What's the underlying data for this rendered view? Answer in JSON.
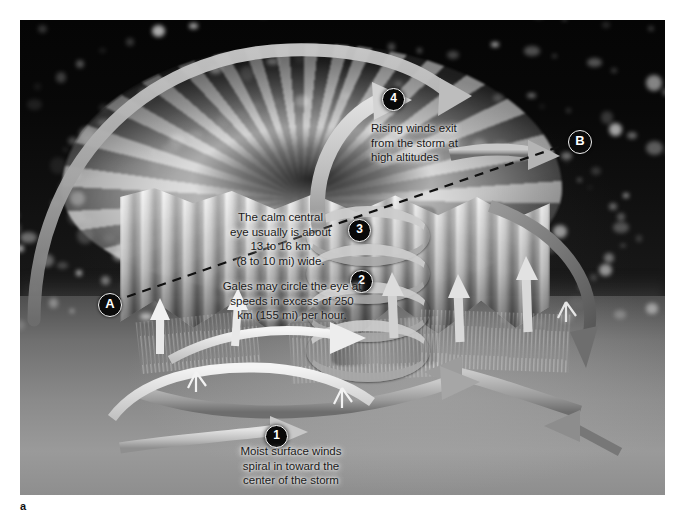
{
  "figure": {
    "panel_letter": "a",
    "frame": {
      "left": 20,
      "top": 20,
      "width": 645,
      "height": 475
    }
  },
  "section_line": {
    "label": "cross-section-line",
    "style": "dashed",
    "endpoints": [
      {
        "id": "A",
        "label": "A",
        "x": 78,
        "y": 273
      },
      {
        "id": "B",
        "label": "B",
        "x": 548,
        "y": 110
      }
    ]
  },
  "annotations": [
    {
      "number": "1",
      "marker": {
        "x": 245,
        "y": 405
      },
      "text": "Moist surface winds\nspiral in  toward the\ncenter of the storm",
      "text_box": {
        "x": 196,
        "y": 424,
        "width": 150
      },
      "align": "center"
    },
    {
      "number": "2",
      "marker": {
        "x": 330,
        "y": 250
      },
      "text": "Gales may circle the eye at\nspeeds in excess of 250\nkm (155 mi) per hour.",
      "text_box": {
        "x": 178,
        "y": 259,
        "width": 188
      },
      "align": "center"
    },
    {
      "number": "3",
      "marker": {
        "x": 328,
        "y": 199
      },
      "text": "The calm central\neye usually is about\n13 to 16 km\n(8 to 10 mi) wide.",
      "text_box": {
        "x": 189,
        "y": 190,
        "width": 143
      },
      "align": "center"
    },
    {
      "number": "4",
      "marker": {
        "x": 362,
        "y": 68
      },
      "text": "Rising winds exit\nfrom the  storm at\nhigh altitudes",
      "text_box": {
        "x": 351,
        "y": 101,
        "width": 126
      },
      "align": "left"
    }
  ],
  "colors": {
    "marker_fill": "#090909",
    "marker_text": "#ffffff",
    "endpoint_fill": "#0b0b0b",
    "endpoint_ring": "#f2f2f2",
    "callout_text": "#1a1a1a",
    "ribbon_light": "#cfcfcf",
    "ribbon_mid": "#a8a8a8",
    "ribbon_dark": "#6e6e6e",
    "ocean": "#8a8a8a",
    "sky": "#080808",
    "cloud": "#f0f0f0"
  },
  "flow_elements": {
    "inflow_arrows": "low-level spiral inflow ribbons at sea surface",
    "eyewall_updrafts": "vertical updraft arrows inside the eyewall",
    "outflow_arrows": "high-altitude outflow ribbons exiting the storm top",
    "helix_loops": 4
  }
}
